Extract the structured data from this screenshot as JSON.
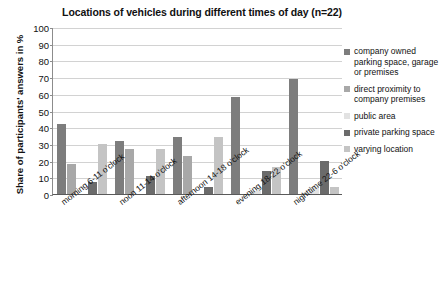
{
  "chart_data": {
    "type": "bar",
    "title": "Locations of vehicles during different times of day (n=22)",
    "xlabel": "",
    "ylabel": "Share of participants' answers in %",
    "ylim": [
      0,
      100
    ],
    "ytick_step": 10,
    "yticks": [
      0,
      10,
      20,
      30,
      40,
      50,
      60,
      70,
      80,
      90,
      100
    ],
    "grid": true,
    "legend_position": "right",
    "categories": [
      "morning 6-11 o'clock",
      "noon 11-14 o'clock",
      "afternoon 14-18 o'clock",
      "evening 18-22 o'clock",
      "nighttime 22-6 o'clock"
    ],
    "series": [
      {
        "name": "company owned parking space, garage or premises",
        "color": "#7d7d7d",
        "values": [
          42,
          32,
          34,
          58,
          69
        ]
      },
      {
        "name": "direct proximity to company premises",
        "color": "#a8a8a8",
        "values": [
          18,
          27,
          23,
          0,
          0
        ]
      },
      {
        "name": "public area",
        "color": "#e2e2e2",
        "values": [
          0,
          0,
          0,
          2,
          4
        ]
      },
      {
        "name": "private parking space",
        "color": "#6b6b6b",
        "values": [
          7,
          11,
          4,
          14,
          20
        ]
      },
      {
        "name": "varying location",
        "color": "#c4c4c4",
        "values": [
          30,
          27,
          34,
          16,
          4
        ]
      }
    ]
  },
  "legend": {
    "items": [
      {
        "label": "company owned parking space, garage or premises",
        "color": "#7d7d7d"
      },
      {
        "label": "direct proximity to company premises",
        "color": "#a8a8a8"
      },
      {
        "label": "public area",
        "color": "#e2e2e2"
      },
      {
        "label": "private parking space",
        "color": "#6b6b6b"
      },
      {
        "label": "varying location",
        "color": "#c4c4c4"
      }
    ]
  }
}
